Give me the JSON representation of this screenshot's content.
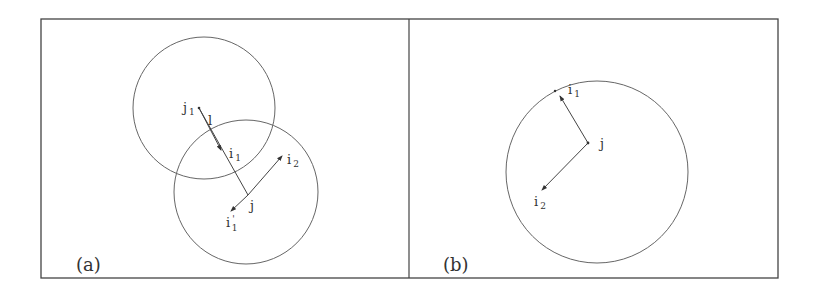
{
  "figure": {
    "colors": {
      "stroke": "#555555",
      "frame": "#444444",
      "text": "#333333",
      "background": "#ffffff"
    },
    "panel_a": {
      "label": "(a)",
      "circles": [
        {
          "name": "circle-upper",
          "cx": 204,
          "cy": 108,
          "r": 71
        },
        {
          "name": "circle-lower",
          "cx": 246,
          "cy": 192,
          "r": 72
        }
      ],
      "nodes": {
        "j1": {
          "main": "j",
          "sub": "1"
        },
        "l": {
          "main": "l"
        },
        "i1": {
          "main": "i",
          "sub": "1"
        },
        "i2": {
          "main": "i",
          "sub": "2"
        },
        "j": {
          "main": "j"
        },
        "i1p": {
          "main": "i",
          "sub": "1",
          "prime": "'"
        }
      }
    },
    "panel_b": {
      "label": "(b)",
      "circles": [
        {
          "name": "circle-main",
          "cx": 597,
          "cy": 172,
          "r": 91
        }
      ],
      "nodes": {
        "i1": {
          "main": "i",
          "sub": "1"
        },
        "j": {
          "main": "j"
        },
        "i2": {
          "main": "i",
          "sub": "2"
        }
      }
    }
  }
}
